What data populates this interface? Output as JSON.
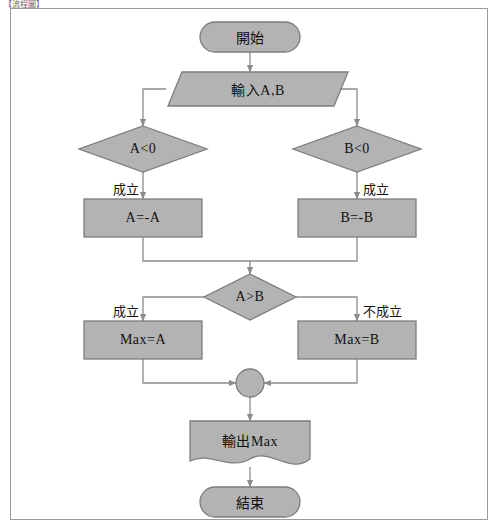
{
  "caption": "【流程圖】",
  "colors": {
    "shape_fill": "#b3b3b3",
    "shape_stroke": "#7d7d7d",
    "line": "#8c8c8c",
    "text": "#111111",
    "frame": "#9a9a9a",
    "background": "#ffffff"
  },
  "diagram": {
    "nodes": [
      {
        "id": "start",
        "type": "terminator",
        "label": "開始"
      },
      {
        "id": "input",
        "type": "parallelogram",
        "label": "輸入A,B"
      },
      {
        "id": "dec_a",
        "type": "decision",
        "label": "A<0"
      },
      {
        "id": "dec_b",
        "type": "decision",
        "label": "B<0"
      },
      {
        "id": "proc_a",
        "type": "process",
        "label": "A=-A"
      },
      {
        "id": "proc_b",
        "type": "process",
        "label": "B=-B"
      },
      {
        "id": "dec_ab",
        "type": "decision",
        "label": "A>B"
      },
      {
        "id": "max_a",
        "type": "process",
        "label": "Max=A"
      },
      {
        "id": "max_b",
        "type": "process",
        "label": "Max=B"
      },
      {
        "id": "merge",
        "type": "connector",
        "label": ""
      },
      {
        "id": "output",
        "type": "document",
        "label": "輸出Max"
      },
      {
        "id": "end",
        "type": "terminator",
        "label": "結束"
      }
    ],
    "edge_labels": {
      "dec_a_true": "成立",
      "dec_b_true": "成立",
      "dec_ab_true": "成立",
      "dec_ab_false": "不成立"
    }
  }
}
